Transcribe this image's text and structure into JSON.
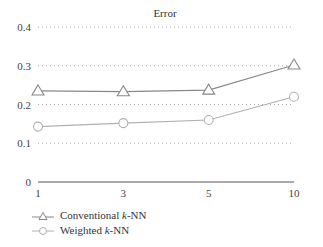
{
  "chart_data": {
    "type": "line",
    "title": "Error",
    "xlabel": "",
    "ylabel": "",
    "x": [
      "1",
      "3",
      "5",
      "10"
    ],
    "ylim": [
      0,
      0.4
    ],
    "yticks": [
      "0",
      "0.1",
      "0.2",
      "0.3",
      "0.4"
    ],
    "grid": "horizontal dotted",
    "legend_position": "bottom-left",
    "series": [
      {
        "name": "Conventional k-NN",
        "marker": "triangle",
        "color": "#888888",
        "values": [
          0.235,
          0.233,
          0.237,
          0.302
        ]
      },
      {
        "name": "Weighted k-NN",
        "marker": "circle",
        "color": "#b0b0b0",
        "values": [
          0.143,
          0.152,
          0.16,
          0.22
        ]
      }
    ]
  },
  "legend": {
    "items": [
      {
        "prefix": "Conventional ",
        "k": "k",
        "suffix": "-NN"
      },
      {
        "prefix": "Weighted ",
        "k": "k",
        "suffix": "-NN"
      }
    ]
  }
}
